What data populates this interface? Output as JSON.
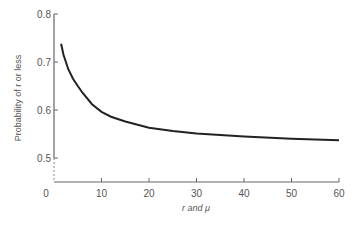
{
  "chart_data": {
    "type": "line",
    "title": "",
    "xlabel": "r and μ",
    "ylabel": "Probability of r or less",
    "xlim": [
      0,
      60
    ],
    "ylim": [
      0.45,
      0.8
    ],
    "x_ticks": [
      "0",
      "10",
      "20",
      "30",
      "40",
      "50",
      "60"
    ],
    "y_ticks": [
      "0.5",
      "0.6",
      "0.7",
      "0.8"
    ],
    "grid": false,
    "series": [
      {
        "name": "P(r or less)",
        "x": [
          1.5,
          2,
          3,
          4,
          5,
          6,
          8,
          10,
          12,
          15,
          20,
          25,
          30,
          40,
          50,
          60
        ],
        "values": [
          0.738,
          0.715,
          0.685,
          0.665,
          0.65,
          0.636,
          0.612,
          0.596,
          0.586,
          0.576,
          0.563,
          0.556,
          0.551,
          0.545,
          0.54,
          0.537
        ]
      }
    ]
  }
}
